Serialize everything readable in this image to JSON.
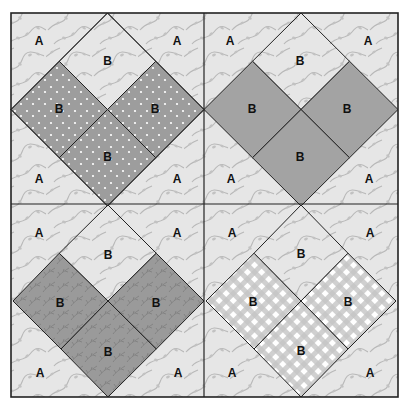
{
  "diagram": {
    "type": "quilt-block-diagram",
    "layout": "2x2 grid of blocks",
    "colors": {
      "background_fabric": "#e6e6e6",
      "vine_print": "#b4b4b4",
      "seam_line": "#222222",
      "dotted_fabric": "#9d9d9d",
      "solid_fabric": "#a3a3a3",
      "leafy_fabric": "#9a9a9a",
      "gingham_fabric": "#cfcfcf"
    },
    "blocks": [
      {
        "position": "top-left",
        "fabric": "dotted",
        "corner_labels": [
          "A",
          "A",
          "A",
          "A"
        ],
        "top_square_label": "B",
        "heart_labels": [
          "B",
          "B",
          "B"
        ]
      },
      {
        "position": "top-right",
        "fabric": "solid",
        "corner_labels": [
          "A",
          "A",
          "A",
          "A"
        ],
        "top_square_label": "B",
        "heart_labels": [
          "B",
          "B",
          "B"
        ]
      },
      {
        "position": "bottom-left",
        "fabric": "leafy",
        "corner_labels": [
          "A",
          "A",
          "A",
          "A"
        ],
        "top_square_label": "B",
        "heart_labels": [
          "B",
          "B",
          "B"
        ]
      },
      {
        "position": "bottom-right",
        "fabric": "gingham",
        "corner_labels": [
          "A",
          "A",
          "A",
          "A"
        ],
        "top_square_label": "B",
        "heart_labels": [
          "B",
          "B",
          "B"
        ]
      }
    ]
  }
}
